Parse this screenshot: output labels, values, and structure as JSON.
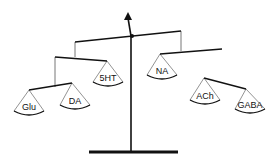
{
  "diagram": {
    "type": "balance-scale-mobile",
    "colors": {
      "line": "#111111",
      "string": "#777777",
      "background": "#ffffff"
    },
    "post": {
      "x1": 131,
      "y1": 152,
      "x2": 131,
      "y2": 36
    },
    "arrow": {
      "from": [
        131,
        36
      ],
      "to": [
        128,
        12
      ]
    },
    "pivot": {
      "cx": 132,
      "cy": 36,
      "r": 2
    },
    "base": {
      "x1": 89,
      "y1": 152,
      "x2": 178,
      "y2": 152
    },
    "beams": [
      {
        "name": "main-beam",
        "x1": 75,
        "y1": 42,
        "x2": 181,
        "y2": 31
      },
      {
        "name": "left-beam",
        "x1": 55,
        "y1": 57,
        "x2": 107,
        "y2": 61
      },
      {
        "name": "left-sub-beam",
        "x1": 29,
        "y1": 90,
        "x2": 72,
        "y2": 83
      },
      {
        "name": "right-beam",
        "x1": 160,
        "y1": 54,
        "x2": 222,
        "y2": 49
      },
      {
        "name": "right-sub-beam",
        "x1": 204,
        "y1": 78,
        "x2": 246,
        "y2": 89
      }
    ],
    "strings": [
      {
        "x1": 75,
        "y1": 42,
        "x2": 75,
        "y2": 57
      },
      {
        "x1": 181,
        "y1": 31,
        "x2": 181,
        "y2": 51
      },
      {
        "x1": 55,
        "y1": 57,
        "x2": 55,
        "y2": 87
      }
    ],
    "pans": [
      {
        "label": "Glu",
        "apex": [
          29,
          90
        ],
        "cx": 29,
        "cy": 113,
        "hw": 15
      },
      {
        "label": "DA",
        "apex": [
          72,
          83
        ],
        "cx": 75,
        "cy": 107,
        "hw": 15
      },
      {
        "label": "5HT",
        "apex": [
          107,
          61
        ],
        "cx": 108,
        "cy": 84,
        "hw": 15
      },
      {
        "label": "NA",
        "apex": [
          160,
          54
        ],
        "cx": 162,
        "cy": 77,
        "hw": 15
      },
      {
        "label": "ACh",
        "apex": [
          204,
          78
        ],
        "cx": 205,
        "cy": 102,
        "hw": 15
      },
      {
        "label": "GABA",
        "apex": [
          246,
          89
        ],
        "cx": 250,
        "cy": 111,
        "hw": 15
      }
    ]
  }
}
